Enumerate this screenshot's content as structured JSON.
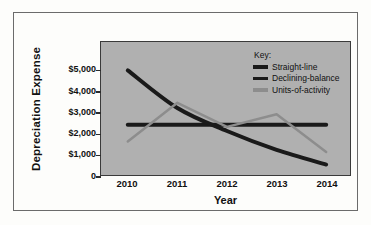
{
  "chart_data": {
    "type": "line",
    "title": "",
    "xlabel": "Year",
    "ylabel": "Depreciation Expense",
    "categories": [
      "2010",
      "2011",
      "2012",
      "2013",
      "2014"
    ],
    "x": [
      2010,
      2011,
      2012,
      2013,
      2014
    ],
    "ylim": [
      0,
      5600
    ],
    "xlim": [
      2009.6,
      2014.4
    ],
    "grid": false,
    "legend_position": "top-right",
    "legend_title": "Key:",
    "y_ticks": [
      {
        "value": 0,
        "label": "0"
      },
      {
        "value": 1000,
        "label": "$1,000"
      },
      {
        "value": 2000,
        "label": "$2,000"
      },
      {
        "value": 3000,
        "label": "$3,000"
      },
      {
        "value": 4000,
        "label": "$4,000"
      },
      {
        "value": 5000,
        "label": "$5,000"
      }
    ],
    "series": [
      {
        "name": "Straight-line",
        "color": "#1a1a1a",
        "width": 4,
        "smooth": false,
        "values": [
          2400,
          2400,
          2400,
          2400,
          2400
        ]
      },
      {
        "name": "Declining-balance",
        "color": "#1a1a1a",
        "width": 4,
        "smooth": true,
        "values": [
          5000,
          3200,
          2100,
          1200,
          500
        ]
      },
      {
        "name": "Units-of-activity",
        "color": "#8d8d8d",
        "width": 2.5,
        "smooth": false,
        "values": [
          1600,
          3450,
          2300,
          2900,
          1100
        ]
      }
    ]
  },
  "legend": {
    "title": "Key:",
    "items": [
      {
        "label": "Straight-line",
        "color": "#1a1a1a"
      },
      {
        "label": "Declining-balance",
        "color": "#1a1a1a"
      },
      {
        "label": "Units-of-activity",
        "color": "#8d8d8d"
      }
    ]
  },
  "axes": {
    "y_title": "Depreciation Expense",
    "x_title": "Year",
    "y_labels": [
      "$5,000",
      "$4,000",
      "$3,000",
      "$2,000",
      "$1,000",
      "0"
    ],
    "x_labels": [
      "2010",
      "2011",
      "2012",
      "2013",
      "2014"
    ]
  },
  "colors": {
    "plot_background": "#b0b0b0",
    "page_background": "#fdfdfb",
    "frame_border": "#6b6b6b",
    "axis": "#2b2b2b",
    "dark_series": "#1a1a1a",
    "light_series": "#8d8d8d"
  }
}
